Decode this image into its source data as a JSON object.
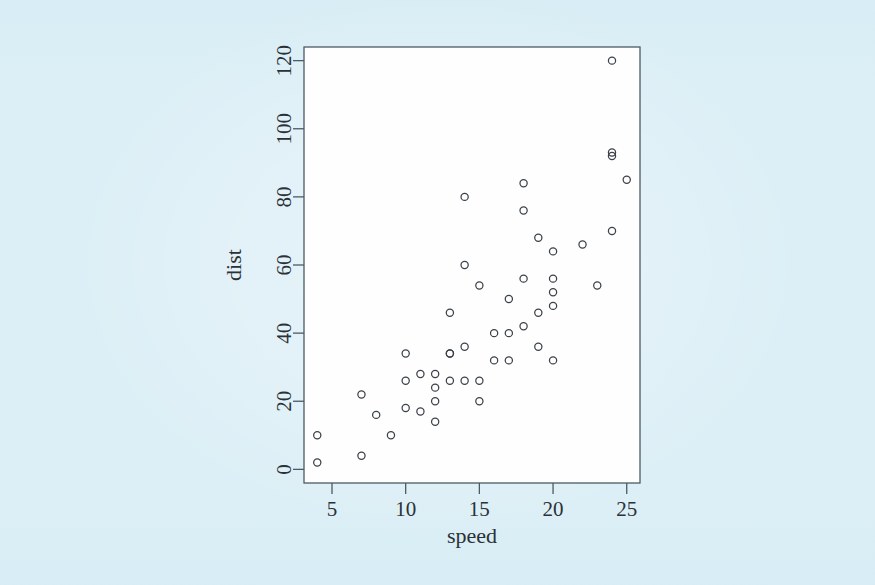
{
  "figure": {
    "background_color": "#dceff6",
    "plot_area_color": "#fefeff",
    "frame_color": "#4b5a64",
    "point_color": "#3b4148",
    "point_marker": "open-circle"
  },
  "chart_data": {
    "type": "scatter",
    "title": "",
    "subtitle": "",
    "xlabel": "speed",
    "ylabel": "dist",
    "xlim": [
      3.1,
      25.9
    ],
    "ylim": [
      -4,
      124
    ],
    "xticks": [
      5,
      10,
      15,
      20,
      25
    ],
    "xtick_labels": [
      "5",
      "10",
      "15",
      "20",
      "25"
    ],
    "yticks": [
      0,
      20,
      40,
      60,
      80,
      100,
      120
    ],
    "ytick_labels": [
      "0",
      "20",
      "40",
      "60",
      "80",
      "100",
      "120"
    ],
    "grid": false,
    "legend": null,
    "legend_position": "none",
    "annotations": [],
    "n_points": 50,
    "series": [
      {
        "name": "cars",
        "marker": "open-circle",
        "color": "#3b4148",
        "x": [
          4,
          4,
          7,
          7,
          8,
          9,
          10,
          10,
          10,
          11,
          11,
          12,
          12,
          12,
          12,
          13,
          13,
          13,
          13,
          14,
          14,
          14,
          14,
          15,
          15,
          15,
          16,
          16,
          17,
          17,
          17,
          18,
          18,
          18,
          18,
          19,
          19,
          19,
          20,
          20,
          20,
          20,
          20,
          22,
          23,
          24,
          24,
          24,
          24,
          25
        ],
        "y": [
          2,
          10,
          4,
          22,
          16,
          10,
          18,
          26,
          34,
          17,
          28,
          14,
          20,
          24,
          28,
          26,
          34,
          34,
          46,
          26,
          36,
          60,
          80,
          20,
          26,
          54,
          32,
          40,
          32,
          40,
          50,
          42,
          56,
          76,
          84,
          36,
          46,
          68,
          32,
          48,
          52,
          56,
          64,
          66,
          54,
          70,
          92,
          93,
          120,
          85
        ]
      }
    ]
  }
}
